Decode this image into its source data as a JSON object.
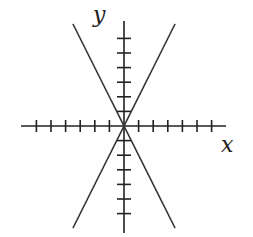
{
  "chart_data": {
    "type": "line",
    "title": "",
    "xlabel": "x",
    "ylabel": "y",
    "xlim": [
      -7,
      7
    ],
    "ylim": [
      -7,
      7
    ],
    "grid": false,
    "x_ticks": [
      -6,
      -5,
      -4,
      -3,
      -2,
      -1,
      1,
      2,
      3,
      4,
      5,
      6
    ],
    "y_ticks": [
      -6,
      -5,
      -4,
      -3,
      -2,
      -1,
      1,
      2,
      3,
      4,
      5,
      6
    ],
    "tick_labels_shown": false,
    "series": [
      {
        "name": "y = 2x",
        "slope": 2,
        "intercept": 0,
        "x": [
          -3.5,
          3.5
        ],
        "y": [
          -7,
          7
        ]
      },
      {
        "name": "y = -2x",
        "slope": -2,
        "intercept": 0,
        "x": [
          -3.5,
          3.5
        ],
        "y": [
          7,
          -7
        ]
      }
    ],
    "colors": {
      "axis": "#222222",
      "lines": "#333333"
    }
  },
  "labels": {
    "x_axis": "x",
    "y_axis": "y"
  }
}
